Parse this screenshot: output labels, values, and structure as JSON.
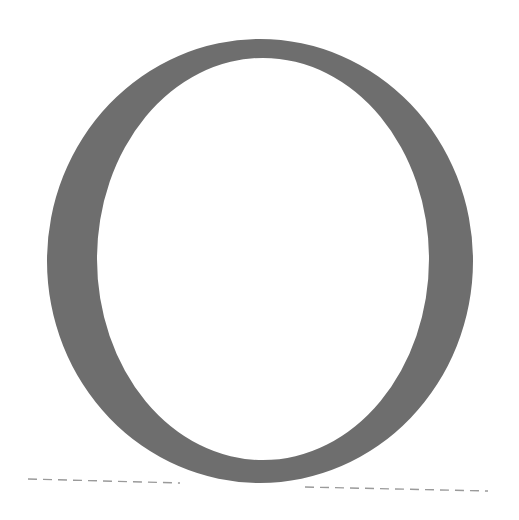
{
  "glyph": {
    "character": "O",
    "color": "#6e6e6e",
    "outer": {
      "cx": 260,
      "cy": 261,
      "rx": 213,
      "ry": 222
    },
    "inner": {
      "cx": 263,
      "cy": 259,
      "rx": 166,
      "ry": 201
    }
  },
  "baselines": {
    "color": "#9a9a9a",
    "left": {
      "x1": 28,
      "y1": 479,
      "x2": 180,
      "y2": 483
    },
    "right": {
      "x1": 305,
      "y1": 487,
      "x2": 488,
      "y2": 491
    },
    "dash": "9,6"
  }
}
